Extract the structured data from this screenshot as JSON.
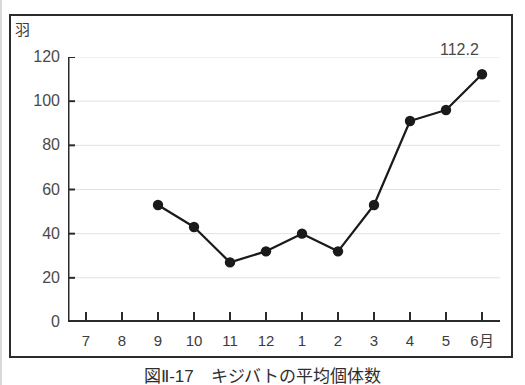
{
  "figure": {
    "unit_label": "羽",
    "caption": "図Ⅱ-17　キジバトの平均個体数",
    "last_value_label": "112.2"
  },
  "chart_data": {
    "type": "line",
    "title": "図Ⅱ-17　キジバトの平均個体数",
    "xlabel": "",
    "ylabel": "羽",
    "ylim": [
      0,
      120
    ],
    "ytick_values": [
      0,
      20,
      40,
      60,
      80,
      100,
      120
    ],
    "ytick_labels": [
      "0",
      "20",
      "40",
      "60",
      "80",
      "100",
      "120"
    ],
    "categories": [
      "7",
      "8",
      "9",
      "10",
      "11",
      "12",
      "1",
      "2",
      "3",
      "4",
      "5",
      "6月"
    ],
    "values": [
      null,
      null,
      53,
      43,
      27,
      32,
      40,
      32,
      53,
      91,
      96,
      112.2
    ],
    "point_labels": [
      "",
      "",
      "",
      "",
      "",
      "",
      "",
      "",
      "",
      "",
      "",
      "112.2"
    ],
    "grid": "horizontal",
    "legend": "none",
    "marker": "filled-circle",
    "line_color": "#1a1a1a",
    "marker_color": "#1a1a1a",
    "grid_color": "#e2e2e2",
    "axis_color": "#2b2b2b"
  }
}
